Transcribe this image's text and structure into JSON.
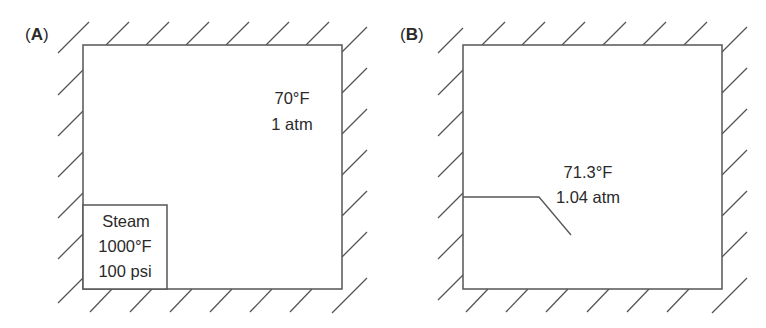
{
  "panels": [
    {
      "id": "A",
      "label_open": "(",
      "label_letter": "A",
      "label_close": ")",
      "room": {
        "temperature": "70°F",
        "pressure": "1 atm"
      },
      "steam_tank": {
        "title": "Steam",
        "temperature": "1000°F",
        "pressure": "100 psi"
      }
    },
    {
      "id": "B",
      "label_open": "(",
      "label_letter": "B",
      "label_close": ")",
      "room": {
        "temperature": "71.3°F",
        "pressure": "1.04 atm"
      }
    }
  ],
  "colors": {
    "line": "#555555",
    "text": "#2a2a2a",
    "background": "#ffffff"
  }
}
